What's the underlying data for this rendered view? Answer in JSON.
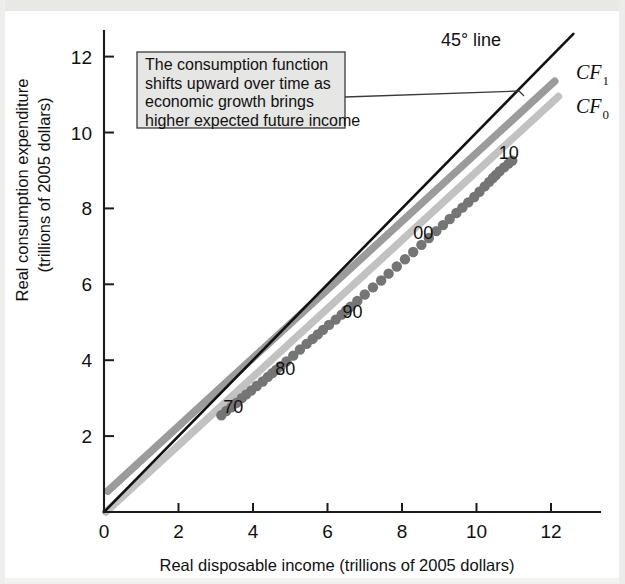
{
  "chart_data": {
    "type": "scatter",
    "title": "",
    "xlabel": "Real disposable income (trillions of 2005 dollars)",
    "ylabel": "Real consumption expenditure (trillions of 2005 dollars)",
    "xlim": [
      0,
      13.3
    ],
    "ylim": [
      0,
      13.0
    ],
    "xticks": [
      0,
      2,
      4,
      6,
      8,
      10,
      12
    ],
    "xtick_labels": [
      "0",
      "2",
      "4",
      "6",
      "8",
      "10",
      "12"
    ],
    "yticks": [
      2,
      4,
      6,
      8,
      10,
      12
    ],
    "ytick_labels": [
      "2",
      "4",
      "6",
      "8",
      "10",
      "12"
    ],
    "grid": false,
    "legend_position": "inline-right",
    "annotations": [
      {
        "name": "callout",
        "text_lines": [
          "The consumption function",
          "shifts upward over time as",
          "economic growth brings",
          "higher expected future income"
        ],
        "points_to": "CF0 and CF1 curves"
      },
      {
        "name": "line-label-45",
        "text": "45° line"
      },
      {
        "name": "curve-label-cf1",
        "text": "CF",
        "subscript": "1"
      },
      {
        "name": "curve-label-cf0",
        "text": "CF",
        "subscript": "0"
      },
      {
        "name": "year-label-70",
        "text": "70",
        "x": 3.2,
        "y": 2.6
      },
      {
        "name": "year-label-80",
        "text": "80",
        "x": 4.6,
        "y": 3.6
      },
      {
        "name": "year-label-90",
        "text": "90",
        "x": 6.4,
        "y": 5.1
      },
      {
        "name": "year-label-00",
        "text": "00",
        "x": 8.3,
        "y": 7.2
      },
      {
        "name": "year-label-10",
        "text": "10",
        "x": 10.6,
        "y": 9.3
      }
    ],
    "series": [
      {
        "name": "45° line",
        "type": "line",
        "color": "#121212",
        "x": [
          0,
          12.6
        ],
        "y": [
          0,
          12.6
        ]
      },
      {
        "name": "CF1",
        "type": "line",
        "color": "#9b9b9b",
        "x": [
          0.1,
          12.1
        ],
        "y": [
          0.55,
          11.35
        ]
      },
      {
        "name": "CF0",
        "type": "line",
        "color": "#c2c2c2",
        "x": [
          0.05,
          12.2
        ],
        "y": [
          0.0,
          10.95
        ]
      },
      {
        "name": "Consumption data points",
        "type": "scatter",
        "color": "#757575",
        "points": [
          [
            3.15,
            2.55
          ],
          [
            3.28,
            2.66
          ],
          [
            3.42,
            2.76
          ],
          [
            3.56,
            2.88
          ],
          [
            3.7,
            3.0
          ],
          [
            3.82,
            3.1
          ],
          [
            3.95,
            3.2
          ],
          [
            4.1,
            3.32
          ],
          [
            4.26,
            3.44
          ],
          [
            4.4,
            3.56
          ],
          [
            4.52,
            3.66
          ],
          [
            4.62,
            3.74
          ],
          [
            4.74,
            3.84
          ],
          [
            4.9,
            3.97
          ],
          [
            5.08,
            4.12
          ],
          [
            5.26,
            4.28
          ],
          [
            5.44,
            4.43
          ],
          [
            5.6,
            4.56
          ],
          [
            5.74,
            4.68
          ],
          [
            5.88,
            4.8
          ],
          [
            6.04,
            4.93
          ],
          [
            6.22,
            5.07
          ],
          [
            6.38,
            5.2
          ],
          [
            6.5,
            5.31
          ],
          [
            6.62,
            5.41
          ],
          [
            6.8,
            5.56
          ],
          [
            7.0,
            5.73
          ],
          [
            7.22,
            5.92
          ],
          [
            7.44,
            6.1
          ],
          [
            7.64,
            6.28
          ],
          [
            7.86,
            6.47
          ],
          [
            8.08,
            6.66
          ],
          [
            8.3,
            6.85
          ],
          [
            8.52,
            7.04
          ],
          [
            8.72,
            7.22
          ],
          [
            8.92,
            7.4
          ],
          [
            9.1,
            7.56
          ],
          [
            9.28,
            7.72
          ],
          [
            9.46,
            7.88
          ],
          [
            9.62,
            8.02
          ],
          [
            9.78,
            8.16
          ],
          [
            9.94,
            8.3
          ],
          [
            10.08,
            8.44
          ],
          [
            10.22,
            8.58
          ],
          [
            10.34,
            8.7
          ],
          [
            10.44,
            8.8
          ],
          [
            10.52,
            8.88
          ],
          [
            10.62,
            8.98
          ],
          [
            10.74,
            9.08
          ],
          [
            10.86,
            9.18
          ],
          [
            10.96,
            9.26
          ]
        ]
      }
    ]
  }
}
